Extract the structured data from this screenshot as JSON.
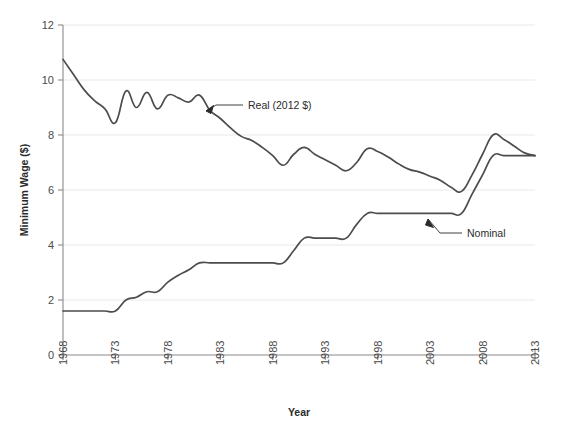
{
  "chart_data": {
    "type": "line",
    "title": "",
    "xlabel": "Year",
    "ylabel": "Minimum Wage ($)",
    "xlim": [
      1968,
      2013
    ],
    "ylim": [
      0,
      12
    ],
    "xticks": [
      "1968",
      "1973",
      "1978",
      "1983",
      "1988",
      "1993",
      "1998",
      "2003",
      "2008",
      "2013"
    ],
    "yticks": [
      "0",
      "2",
      "4",
      "6",
      "8",
      "10",
      "12"
    ],
    "grid": true,
    "legend_position": "inline-annotations",
    "annotations": [
      {
        "text": "Real (2012 $)",
        "target_year": 1981,
        "target_value": 8.45
      },
      {
        "text": "Nominal",
        "target_year": 2004,
        "target_value": 5.15
      }
    ],
    "x": [
      1968,
      1969,
      1970,
      1971,
      1972,
      1973,
      1974,
      1975,
      1976,
      1977,
      1978,
      1979,
      1980,
      1981,
      1982,
      1983,
      1984,
      1985,
      1986,
      1987,
      1988,
      1989,
      1990,
      1991,
      1992,
      1993,
      1994,
      1995,
      1996,
      1997,
      1998,
      1999,
      2000,
      2001,
      2002,
      2003,
      2004,
      2005,
      2006,
      2007,
      2008,
      2009,
      2010,
      2011,
      2012,
      2013
    ],
    "series": [
      {
        "name": "Real (2012 $)",
        "values": [
          10.75,
          10.2,
          9.65,
          9.25,
          8.95,
          8.45,
          9.6,
          9.0,
          9.55,
          8.95,
          9.45,
          9.35,
          9.2,
          9.45,
          8.9,
          8.6,
          8.25,
          7.95,
          7.8,
          7.55,
          7.25,
          6.9,
          7.3,
          7.55,
          7.3,
          7.1,
          6.9,
          6.7,
          7.0,
          7.5,
          7.4,
          7.2,
          6.95,
          6.75,
          6.65,
          6.5,
          6.35,
          6.1,
          5.95,
          6.55,
          7.3,
          8.0,
          7.85,
          7.6,
          7.35,
          7.25
        ]
      },
      {
        "name": "Nominal",
        "values": [
          1.6,
          1.6,
          1.6,
          1.6,
          1.6,
          1.6,
          2.0,
          2.1,
          2.3,
          2.3,
          2.65,
          2.9,
          3.1,
          3.35,
          3.35,
          3.35,
          3.35,
          3.35,
          3.35,
          3.35,
          3.35,
          3.35,
          3.8,
          4.25,
          4.25,
          4.25,
          4.25,
          4.25,
          4.75,
          5.15,
          5.15,
          5.15,
          5.15,
          5.15,
          5.15,
          5.15,
          5.15,
          5.15,
          5.15,
          5.85,
          6.55,
          7.25,
          7.25,
          7.25,
          7.25,
          7.25
        ]
      }
    ]
  }
}
